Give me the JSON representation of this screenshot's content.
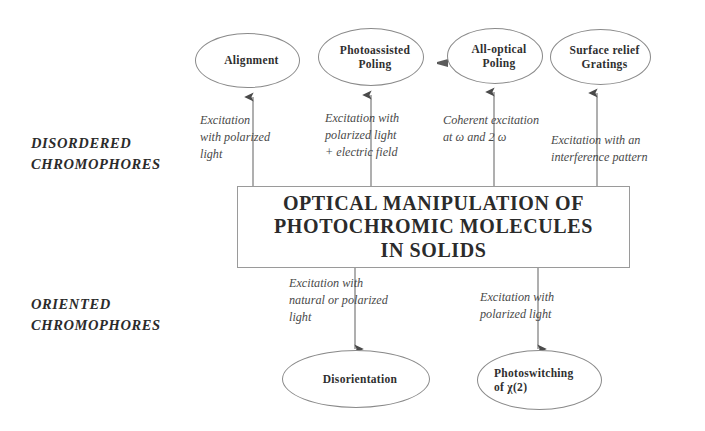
{
  "diagram": {
    "title": "OPTICAL MANIPULATION OF PHOTOCHROMIC MOLECULES IN SOLIDS",
    "center": {
      "line1": "OPTICAL MANIPULATION OF",
      "line2": "PHOTOCHROMIC MOLECULES",
      "line3": "IN SOLIDS"
    },
    "side_labels": [
      {
        "id": "disordered",
        "text": "DISORDERED\nCHROMOPHORES"
      },
      {
        "id": "oriented",
        "text": "ORIENTED\nCHROMOPHORES"
      }
    ],
    "top_nodes": [
      {
        "id": "alignment",
        "line1": "Alignment",
        "line2": ""
      },
      {
        "id": "photoassisted-poling",
        "line1": "Photoassisted",
        "line2": "Poling"
      },
      {
        "id": "all-optical-poling",
        "line1": "All-optical",
        "line2": "Poling"
      },
      {
        "id": "surface-relief-gratings",
        "line1": "Surface relief",
        "line2": "Gratings"
      }
    ],
    "bottom_nodes": [
      {
        "id": "disorientation",
        "line1": "Disorientation",
        "line2": ""
      },
      {
        "id": "photoswitching",
        "line1": "Photoswitching",
        "line2": "of χ(2)"
      }
    ],
    "top_edge_labels": [
      {
        "id": "alignment-edge",
        "text": "Excitation\nwith polarized\nlight"
      },
      {
        "id": "photoassisted-edge",
        "text": "Excitation with\npolarized light\n+ electric field"
      },
      {
        "id": "all-optical-edge",
        "text": "Coherent excitation\nat ω and 2 ω"
      },
      {
        "id": "surface-relief-edge",
        "text": "Excitation with an\ninterference pattern"
      }
    ],
    "bottom_edge_labels": [
      {
        "id": "disorientation-edge",
        "text": "Excitation with\nnatural or polarized\nlight"
      },
      {
        "id": "photoswitching-edge",
        "text": "Excitation with\npolarized light"
      }
    ],
    "colors": {
      "background": "#ffffff",
      "stroke": "#6d6d6d",
      "node_stroke": "#8a8a8a",
      "text": "#2f2f2f",
      "edge_label_text": "#4a4a4a"
    }
  }
}
